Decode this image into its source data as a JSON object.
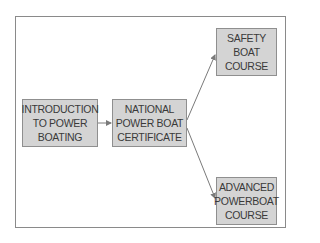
{
  "diagram": {
    "type": "flowchart",
    "nodes": [
      {
        "id": "intro",
        "label": "INTRODUCTION\nTO POWER\nBOATING"
      },
      {
        "id": "national",
        "label": "NATIONAL\nPOWER BOAT\nCERTIFICATE"
      },
      {
        "id": "safety",
        "label": "SAFETY\nBOAT\nCOURSE"
      },
      {
        "id": "advanced",
        "label": "ADVANCED\nPOWERBOAT\nCOURSE"
      }
    ],
    "edges": [
      {
        "from": "intro",
        "to": "national"
      },
      {
        "from": "national",
        "to": "safety"
      },
      {
        "from": "national",
        "to": "advanced"
      }
    ],
    "colors": {
      "box_fill": "#d4d4d4",
      "box_border": "#8f8f8f",
      "arrow": "#7a7a7a",
      "text": "#3a3a3a"
    }
  }
}
